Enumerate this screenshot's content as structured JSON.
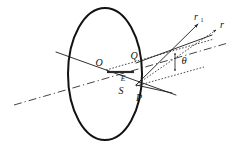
{
  "figure": {
    "kind": "optical-ray-geometry-diagram",
    "background_color": "#ffffff",
    "ink_color": "#111111",
    "width": 231,
    "height": 151
  },
  "labels": {
    "center_point": "O",
    "upper_surface_point": "Q",
    "lower_surface_point": "S",
    "ray_origin_point": "P",
    "segment_end_point": "E",
    "refracted_ray": "r",
    "incident_ray_base": "r",
    "incident_ray_subscript": "1",
    "angle": "θ"
  },
  "geometry": {
    "ellipse": {
      "center_x": 105,
      "center_y": 74,
      "radius_x": 37,
      "radius_y": 66
    },
    "points": {
      "O": {
        "x": 105,
        "y": 69
      },
      "Q": {
        "x": 136,
        "y": 62
      },
      "E": {
        "x": 133,
        "y": 77
      },
      "S": {
        "x": 125,
        "y": 84
      },
      "P": {
        "x": 138,
        "y": 84
      }
    },
    "angle_arc": {
      "label": "θ",
      "label_x": 183,
      "label_y": 61
    }
  },
  "elements": {
    "ellipse_outline": "ellipse-outline",
    "axis_line_dashdot": "dash-dot-axis-line",
    "chord_line_solid": "solid-chord-line",
    "thick_segment_OE": "thick-segment-o-to-e",
    "ray_r1_solid": "solid-ray-r1",
    "ray_r_dotted": "dotted-ray-r",
    "dotted_guide_upper": "dotted-guide-upper",
    "dotted_guide_lower": "dotted-guide-lower",
    "p_lines": "lines-from-p",
    "theta_indicator": "theta-double-arrow"
  }
}
